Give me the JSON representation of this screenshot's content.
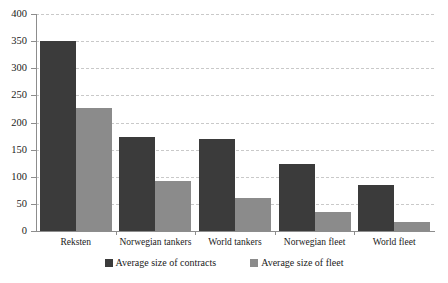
{
  "chart_data": {
    "type": "bar",
    "title": "",
    "xlabel": "",
    "ylabel": "",
    "ylim": [
      0,
      400
    ],
    "yticks": [
      0,
      50,
      100,
      150,
      200,
      250,
      300,
      350,
      400
    ],
    "grid": true,
    "legend_position": "bottom",
    "categories": [
      "Reksten",
      "Norwegian tankers",
      "World tankers",
      "Norwegian fleet",
      "World fleet"
    ],
    "series": [
      {
        "name": "Average size of contracts",
        "color": "#3b3b3b",
        "values": [
          350,
          173,
          170,
          124,
          84
        ]
      },
      {
        "name": "Average size of fleet",
        "color": "#8b8b8b",
        "values": [
          227,
          92,
          61,
          35,
          17
        ]
      }
    ]
  },
  "axis": {
    "y_labels": [
      "400",
      "350",
      "300",
      "250",
      "200",
      "150",
      "100",
      "50",
      "0"
    ]
  },
  "legend": {
    "items": [
      {
        "label": "Average size of contracts",
        "color": "#3b3b3b"
      },
      {
        "label": "Average size of fleet",
        "color": "#8b8b8b"
      }
    ]
  }
}
